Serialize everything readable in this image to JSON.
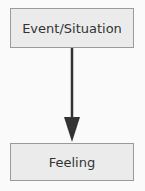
{
  "diagram": {
    "nodes": [
      {
        "id": "event",
        "label": "Event/Situation"
      },
      {
        "id": "feeling",
        "label": "Feeling"
      }
    ],
    "edges": [
      {
        "from": "event",
        "to": "feeling",
        "type": "arrow"
      }
    ],
    "colors": {
      "box_fill": "#ebebeb",
      "box_border": "#9a9a9a",
      "arrow": "#333333",
      "text": "#333333"
    }
  }
}
